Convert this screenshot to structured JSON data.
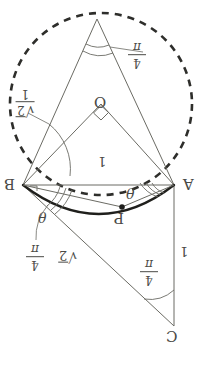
{
  "figure": {
    "orientation_note": "All text labels rendered rotated 180 degrees",
    "background_color": "#ffffff",
    "line_color": "#4a4a46",
    "emphasis_color": "#2b2b28",
    "points": {
      "apex": {
        "label": "",
        "x": 97,
        "y": 19
      },
      "O": {
        "label": "O",
        "x": 101,
        "y": 104,
        "label_x": 95,
        "label_y": 97
      },
      "B": {
        "label": "B",
        "x": 23,
        "y": 185,
        "label_x": 6,
        "label_y": 179
      },
      "A": {
        "label": "A",
        "x": 174,
        "y": 185,
        "label_x": 183,
        "label_y": 179
      },
      "P": {
        "label": "P",
        "x": 122,
        "y": 207,
        "label_x": 116,
        "label_y": 212
      },
      "C": {
        "label": "C",
        "x": 174,
        "y": 326,
        "label_x": 168,
        "label_y": 330
      }
    },
    "labels": {
      "side_one_center": "1",
      "side_one_right": "1",
      "theta_at_A": "θ",
      "theta_at_B": "θ",
      "point_O": "O",
      "point_A": "A",
      "point_B": "B",
      "point_C": "C",
      "point_P": "P"
    },
    "fractions": {
      "pi_over_4_apex": {
        "numerator": "π",
        "denominator": "4"
      },
      "pi_over_4_lower_left": {
        "numerator": "π",
        "denominator": "4"
      },
      "pi_over_4_at_C": {
        "numerator": "π",
        "denominator": "4"
      }
    },
    "radicals": {
      "sqrt2_lower": {
        "text": "√2",
        "radicand": "2"
      },
      "sqrt2_upper_left": {
        "text": "1/√2",
        "numerator": "1",
        "radicand": "2"
      }
    },
    "circle": {
      "center_x": 101,
      "center_y": 104,
      "radius": 91,
      "style": "dashed"
    },
    "arc": {
      "description": "thick arc through B, P, A bulging below chord AB",
      "style": "solid-thick"
    },
    "right_angle_marker": {
      "at": "O",
      "description": "small square indicating right angle at center O between OA and OB"
    }
  }
}
